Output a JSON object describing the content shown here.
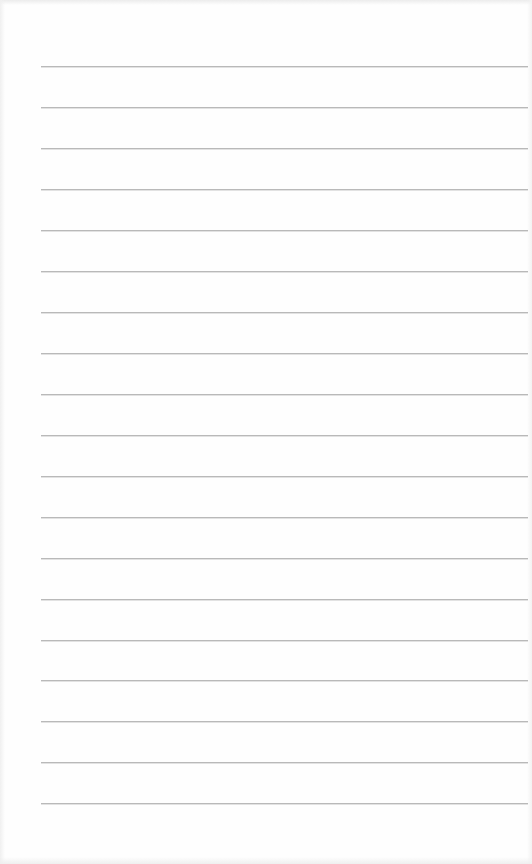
{
  "page": {
    "type": "lined-notepad",
    "background_color": "#fefefe",
    "line_color": "#b9b9b9",
    "line_count": 19,
    "line_left": 41,
    "line_width": 487,
    "first_line_y": 66,
    "line_spacing": 40.95,
    "lines": [
      {
        "y": 66,
        "text": ""
      },
      {
        "y": 107,
        "text": ""
      },
      {
        "y": 148,
        "text": ""
      },
      {
        "y": 189,
        "text": ""
      },
      {
        "y": 230,
        "text": ""
      },
      {
        "y": 271,
        "text": ""
      },
      {
        "y": 312,
        "text": ""
      },
      {
        "y": 353,
        "text": ""
      },
      {
        "y": 394,
        "text": ""
      },
      {
        "y": 435,
        "text": ""
      },
      {
        "y": 476,
        "text": ""
      },
      {
        "y": 517,
        "text": ""
      },
      {
        "y": 558,
        "text": ""
      },
      {
        "y": 599,
        "text": ""
      },
      {
        "y": 640,
        "text": ""
      },
      {
        "y": 680,
        "text": ""
      },
      {
        "y": 721,
        "text": ""
      },
      {
        "y": 762,
        "text": ""
      },
      {
        "y": 803,
        "text": ""
      }
    ]
  }
}
